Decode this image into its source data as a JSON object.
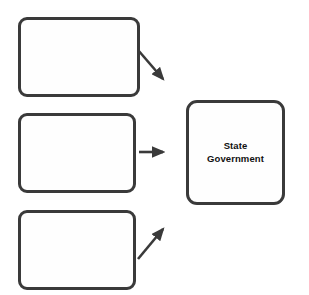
{
  "diagram": {
    "type": "flow-diagram",
    "orientation": "left-to-right",
    "background_color": "#ffffff",
    "stroke_color": "#3a3a3a",
    "fill_color": "#fefefe",
    "text_color": "#111111",
    "nodes": [
      {
        "id": "source-top",
        "label": "",
        "filled_in": false,
        "position": {
          "x": 18,
          "y": 17,
          "width": 122,
          "height": 80
        }
      },
      {
        "id": "source-middle",
        "label": "",
        "filled_in": false,
        "position": {
          "x": 18,
          "y": 113,
          "width": 118,
          "height": 80
        }
      },
      {
        "id": "source-bottom",
        "label": "",
        "filled_in": false,
        "position": {
          "x": 18,
          "y": 210,
          "width": 118,
          "height": 80
        }
      },
      {
        "id": "state-government",
        "label": "State\nGovernment",
        "filled_in": true,
        "position": {
          "x": 186,
          "y": 100,
          "width": 99,
          "height": 105
        }
      }
    ],
    "connectors": [
      {
        "id": "arrow-top-to-target",
        "from": "source-top",
        "to": "state-government",
        "direction": "down-right",
        "start": {
          "x": 138,
          "y": 50
        },
        "end": {
          "x": 166,
          "y": 82
        }
      },
      {
        "id": "arrow-middle-to-target",
        "from": "source-middle",
        "to": "state-government",
        "direction": "right",
        "start": {
          "x": 139,
          "y": 152
        },
        "end": {
          "x": 167,
          "y": 152
        }
      },
      {
        "id": "arrow-bottom-to-target",
        "from": "source-bottom",
        "to": "state-government",
        "direction": "up-right",
        "start": {
          "x": 138,
          "y": 259
        },
        "end": {
          "x": 166,
          "y": 226
        }
      }
    ]
  }
}
